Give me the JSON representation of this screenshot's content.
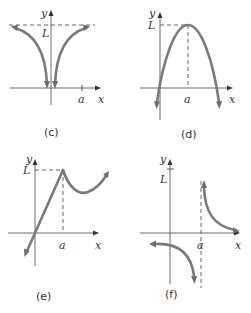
{
  "figure": {
    "panels": [
      {
        "id": "c",
        "caption": "(c)",
        "x_axis_label": "x",
        "y_axis_label": "y",
        "limit_label": "L",
        "point_label": "a",
        "description": "Two branches approaching horizontal asymptote y = L from below as x goes to plus/minus infinity, and going down to minus infinity near x = 0"
      },
      {
        "id": "d",
        "caption": "(d)",
        "x_axis_label": "x",
        "y_axis_label": "y",
        "limit_label": "L",
        "point_label": "a",
        "description": "Downward-opening parabola with maximum value L at x = a"
      },
      {
        "id": "e",
        "caption": "(e)",
        "x_axis_label": "x",
        "y_axis_label": "y",
        "limit_label": "L",
        "point_label": "a",
        "description": "Line rising through origin to a cusp at (a, L), then dipping and rising again"
      },
      {
        "id": "f",
        "caption": "(f)",
        "x_axis_label": "x",
        "y_axis_label": "y",
        "limit_label": "L",
        "point_label": "a",
        "description": "Hyperbola-like curve with vertical asymptote at x = a; left branch goes down to minus infinity, right branch goes up to plus infinity and approaches the x-axis"
      }
    ],
    "colors": {
      "curve": "#7a7a7a",
      "axis": "#6a6a6a",
      "text": "#333333",
      "background": "#ffffff"
    }
  }
}
